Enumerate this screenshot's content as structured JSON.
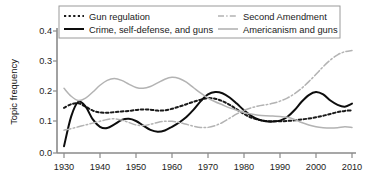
{
  "chart_data": {
    "type": "line",
    "title": "",
    "xlabel": "",
    "ylabel": "Topic frequency",
    "xlim": [
      1930,
      2012
    ],
    "ylim": [
      0.0,
      0.42
    ],
    "grid": false,
    "legend_position": "top-center",
    "xticks": [
      "1930",
      "1940",
      "1950",
      "1960",
      "1970",
      "1980",
      "1990",
      "2000",
      "2010"
    ],
    "xtick_values": [
      1930,
      1940,
      1950,
      1960,
      1970,
      1980,
      1990,
      2000,
      2010
    ],
    "yticks": [
      "0.0",
      "0.1",
      "0.2",
      "0.3",
      "0.4"
    ],
    "ytick_values": [
      0.0,
      0.1,
      0.2,
      0.3,
      0.4
    ],
    "x": [
      1930,
      1932,
      1934,
      1936,
      1938,
      1940,
      1942,
      1944,
      1946,
      1948,
      1950,
      1952,
      1954,
      1956,
      1958,
      1960,
      1962,
      1964,
      1966,
      1968,
      1970,
      1972,
      1974,
      1976,
      1978,
      1980,
      1982,
      1984,
      1986,
      1988,
      1990,
      1992,
      1994,
      1996,
      1998,
      2000,
      2002,
      2004,
      2006,
      2008,
      2010
    ],
    "series": [
      {
        "name": "Gun regulation",
        "style": "dashed",
        "color": "#1a1a1a",
        "values": [
          0.148,
          0.16,
          0.163,
          0.152,
          0.139,
          0.133,
          0.132,
          0.134,
          0.136,
          0.138,
          0.141,
          0.143,
          0.142,
          0.139,
          0.14,
          0.145,
          0.152,
          0.16,
          0.168,
          0.175,
          0.18,
          0.178,
          0.17,
          0.158,
          0.143,
          0.128,
          0.116,
          0.109,
          0.105,
          0.104,
          0.104,
          0.105,
          0.107,
          0.11,
          0.113,
          0.117,
          0.122,
          0.128,
          0.134,
          0.138,
          0.14
        ]
      },
      {
        "name": "Crime, self-defense, and guns",
        "style": "solid",
        "color": "#0d0d0d",
        "values": [
          0.022,
          0.12,
          0.168,
          0.152,
          0.11,
          0.086,
          0.082,
          0.094,
          0.108,
          0.112,
          0.105,
          0.09,
          0.076,
          0.07,
          0.074,
          0.086,
          0.1,
          0.118,
          0.142,
          0.17,
          0.192,
          0.2,
          0.196,
          0.182,
          0.162,
          0.14,
          0.122,
          0.11,
          0.104,
          0.103,
          0.106,
          0.118,
          0.14,
          0.168,
          0.19,
          0.2,
          0.192,
          0.172,
          0.158,
          0.152,
          0.162
        ]
      },
      {
        "name": "Second Amendment",
        "style": "dashdot",
        "color": "#b3b3b3",
        "values": [
          0.075,
          0.08,
          0.086,
          0.092,
          0.098,
          0.104,
          0.11,
          0.112,
          0.108,
          0.1,
          0.092,
          0.09,
          0.094,
          0.1,
          0.104,
          0.104,
          0.1,
          0.094,
          0.088,
          0.084,
          0.084,
          0.09,
          0.1,
          0.114,
          0.128,
          0.14,
          0.148,
          0.154,
          0.158,
          0.163,
          0.17,
          0.18,
          0.194,
          0.212,
          0.234,
          0.258,
          0.283,
          0.305,
          0.322,
          0.332,
          0.336
        ]
      },
      {
        "name": "Americanism and guns",
        "style": "solid",
        "color": "#b3b3b3",
        "values": [
          0.212,
          0.186,
          0.172,
          0.18,
          0.2,
          0.222,
          0.238,
          0.244,
          0.238,
          0.226,
          0.215,
          0.212,
          0.218,
          0.23,
          0.242,
          0.248,
          0.244,
          0.232,
          0.214,
          0.196,
          0.18,
          0.168,
          0.158,
          0.148,
          0.14,
          0.133,
          0.128,
          0.124,
          0.122,
          0.121,
          0.12,
          0.117,
          0.11,
          0.1,
          0.092,
          0.086,
          0.083,
          0.082,
          0.083,
          0.086,
          0.084
        ]
      }
    ]
  },
  "legend": {
    "entries": [
      {
        "label": "Gun regulation",
        "style": "dashed",
        "color": "#1a1a1a"
      },
      {
        "label": "Crime, self-defense, and guns",
        "style": "solid",
        "color": "#0d0d0d"
      },
      {
        "label": "Second Amendment",
        "style": "dashdot",
        "color": "#b3b3b3"
      },
      {
        "label": "Americanism and guns",
        "style": "solid",
        "color": "#b3b3b3"
      }
    ]
  },
  "axes": {
    "ylabel": "Topic frequency",
    "ytick_labels": [
      "0.4",
      "0.3",
      "0.2",
      "0.1",
      "0.0"
    ],
    "xtick_labels": [
      "1930",
      "1940",
      "1950",
      "1960",
      "1970",
      "1980",
      "1990",
      "2000",
      "2010"
    ]
  },
  "colors": {
    "dark": "#0d0d0d",
    "gray": "#b3b3b3",
    "spine": "#8a8a8a",
    "background": "#ffffff"
  }
}
